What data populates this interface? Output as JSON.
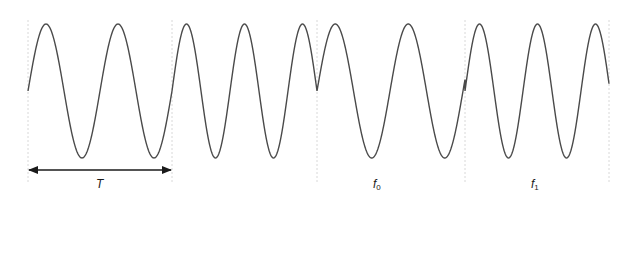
{
  "diagram": {
    "colors": {
      "wave": "#4a4a4a",
      "guide": "#d8d8d8",
      "arrow": "#1a1a1a",
      "background": "#ffffff"
    },
    "baseline_y": 91,
    "amplitude": 67,
    "segments": [
      {
        "x_start": 28,
        "x_end": 172,
        "period": 72,
        "phase": 0
      },
      {
        "x_start": 172,
        "x_end": 317,
        "period": 58,
        "phase": 0
      },
      {
        "x_start": 317,
        "x_end": 465,
        "period": 73,
        "phase": 0
      },
      {
        "x_start": 465,
        "x_end": 609,
        "period": 58,
        "phase": 0
      }
    ],
    "guidelines_x": [
      28,
      172,
      317,
      465,
      609
    ],
    "guideline_y_range": [
      20,
      182
    ],
    "period_arrow": {
      "x1": 28,
      "x2": 172,
      "y": 170
    },
    "labels": {
      "period": "T",
      "f0_base": "f",
      "f0_sub": "0",
      "f1_base": "f",
      "f1_sub": "1"
    }
  }
}
